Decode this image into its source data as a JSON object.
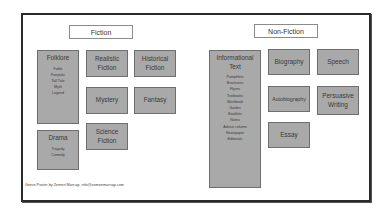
{
  "poster": {
    "footer": "Genre Poster by Zemen Marrugi, info@zemenmarrugi.com",
    "colors": {
      "box_fill": "#a9a9a9",
      "box_border": "#6e6e6e",
      "frame": "#2a2a2a"
    }
  },
  "fiction": {
    "title": "Fiction",
    "folklore": {
      "label": "Folklore",
      "items": [
        "Fable",
        "Fairytale",
        "Tall Tale",
        "Myth",
        "Legend"
      ]
    },
    "realistic": {
      "line1": "Realistic",
      "line2": "Fiction"
    },
    "historical": {
      "line1": "Historical",
      "line2": "Fiction"
    },
    "mystery": {
      "label": "Mystery"
    },
    "fantasy": {
      "label": "Fantasy"
    },
    "drama": {
      "label": "Drama",
      "items": [
        "Tragedy",
        "Comedy"
      ]
    },
    "science": {
      "line1": "Science",
      "line2": "Fiction"
    }
  },
  "nonfiction": {
    "title": "Non-Fiction",
    "informational": {
      "line1": "Informational",
      "line2": "Text",
      "items": [
        "Pamphlets",
        "Brochures",
        "Flyers",
        "Textbooks",
        "Workbook",
        "Guides",
        "Booklets",
        "Notes",
        "Advice column",
        "Newspaper",
        "Editorials"
      ]
    },
    "biography": {
      "label": "Biography"
    },
    "speech": {
      "label": "Speech"
    },
    "autobiography": {
      "label": "Autobiography"
    },
    "persuasive": {
      "line1": "Persuasive",
      "line2": "Writing"
    },
    "essay": {
      "label": "Essay"
    }
  }
}
